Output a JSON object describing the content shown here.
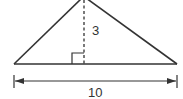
{
  "diagram": {
    "type": "triangle-area",
    "shape": "triangle",
    "height_label": "3",
    "base_label": "10",
    "stroke_color": "#333333",
    "background": "#ffffff",
    "features": [
      "dashed altitude",
      "right-angle marker",
      "base dimension arrow"
    ]
  }
}
